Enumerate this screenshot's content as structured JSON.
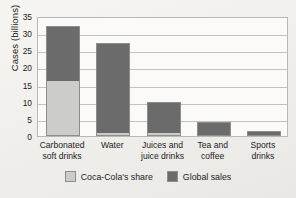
{
  "chart_data": {
    "type": "bar",
    "stacked": true,
    "title": "",
    "xlabel": "",
    "ylabel": "Cases (billions)",
    "ylim": [
      0,
      35
    ],
    "yticks": [
      0,
      5,
      10,
      15,
      20,
      25,
      30,
      35
    ],
    "ytick_labels": [
      "0",
      "5",
      "10",
      "15",
      "20",
      "25",
      "30",
      "35"
    ],
    "grid": true,
    "legend_position": "bottom-center",
    "categories": [
      "Carbonated soft drinks",
      "Water",
      "Juices and juice drinks",
      "Tea and coffee",
      "Sports drinks"
    ],
    "category_lines": [
      [
        "Carbonated",
        "soft drinks"
      ],
      [
        "Water",
        ""
      ],
      [
        "Juices and",
        "juice drinks"
      ],
      [
        "Tea and",
        "coffee"
      ],
      [
        "Sports",
        "drinks"
      ]
    ],
    "series": [
      {
        "name": "Coca-Cola's share",
        "color": "#ccccca",
        "values": [
          16,
          1,
          1,
          0,
          0
        ]
      },
      {
        "name": "Global sales",
        "color": "#6b6b6b",
        "values": [
          16,
          26,
          9,
          4,
          1.5
        ]
      }
    ],
    "totals": [
      32,
      27,
      10,
      4,
      1.5
    ]
  },
  "legend": {
    "items": [
      {
        "label": "Coca-Cola's share",
        "color": "#ccccca"
      },
      {
        "label": "Global sales",
        "color": "#6b6b6b"
      }
    ]
  },
  "colors": {
    "light_gray": "#ccccca",
    "dark_gray": "#6b6b6b",
    "outline": "#8d8d8b",
    "gridline": "#c3c2be",
    "plot_background": "#fbfaf8",
    "page_background": "#f2f1ee",
    "text": "#1c1c1c"
  }
}
